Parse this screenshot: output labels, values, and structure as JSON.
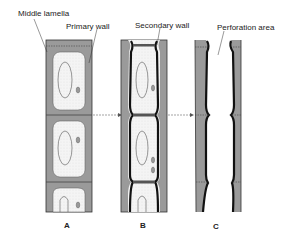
{
  "diagram": {
    "labels": {
      "middle_lamella": "Middle lamella",
      "primary_wall": "Primary wall",
      "secondary_wall": "Secondary wall",
      "perforation_area": "Perforation area"
    },
    "panels": [
      {
        "id": "A"
      },
      {
        "id": "B"
      },
      {
        "id": "C"
      }
    ],
    "colors": {
      "wall_gray": "#9a9a9a",
      "cytoplasm": "#f2f2f2",
      "secondary_wall": "#111111",
      "outline": "#333333"
    }
  }
}
